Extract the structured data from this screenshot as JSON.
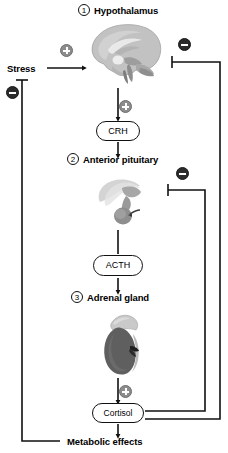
{
  "diagram": {
    "type": "biological-pathway-flowchart",
    "colors": {
      "line": "#111111",
      "plus_badge": "#8c8c8c",
      "minus_badge": "#2b2b2b",
      "background": "#ffffff",
      "anatomy_gray_light": "#c9c9c9",
      "anatomy_gray_mid": "#9a9a9a",
      "anatomy_gray_dark": "#6a6a6a"
    }
  },
  "nodes": {
    "stress": {
      "label": "Stress"
    },
    "hypothalamus": {
      "number": "1",
      "label": "Hypothalamus",
      "image": "brain-sagittal-icon"
    },
    "crh": {
      "label": "CRH"
    },
    "anterior_pituitary": {
      "number": "2",
      "label": "Anterior pituitary",
      "image": "pituitary-gland-icon"
    },
    "acth": {
      "label": "ACTH"
    },
    "adrenal_gland": {
      "number": "3",
      "label": "Adrenal gland",
      "image": "adrenal-kidney-icon"
    },
    "cortisol": {
      "label": "Cortisol"
    },
    "metabolic_effects": {
      "label": "Metabolic effects"
    }
  },
  "signs": {
    "stress_to_hypothalamus": {
      "symbol": "+",
      "name": "plus-sign"
    },
    "cortisol_inhibits_stress": {
      "symbol": "−",
      "name": "minus-sign"
    },
    "cortisol_inhibits_hypothalamus": {
      "symbol": "−",
      "name": "minus-sign"
    },
    "hypothalamus_to_crh": {
      "symbol": "+",
      "name": "plus-sign"
    },
    "cortisol_inhibits_pituitary": {
      "symbol": "−",
      "name": "minus-sign"
    },
    "adrenal_to_cortisol": {
      "symbol": "+",
      "name": "plus-sign"
    }
  },
  "edges": [
    {
      "from": "stress",
      "to": "hypothalamus",
      "kind": "stimulatory",
      "sign": "+"
    },
    {
      "from": "hypothalamus",
      "to": "crh",
      "kind": "stimulatory",
      "sign": "+"
    },
    {
      "from": "crh",
      "to": "anterior_pituitary",
      "kind": "stimulatory"
    },
    {
      "from": "anterior_pituitary",
      "to": "acth",
      "kind": "stimulatory"
    },
    {
      "from": "acth",
      "to": "adrenal_gland",
      "kind": "stimulatory"
    },
    {
      "from": "adrenal_gland",
      "to": "cortisol",
      "kind": "stimulatory",
      "sign": "+"
    },
    {
      "from": "cortisol",
      "to": "metabolic_effects",
      "kind": "stimulatory"
    },
    {
      "from": "cortisol",
      "to": "hypothalamus",
      "kind": "inhibitory",
      "sign": "−"
    },
    {
      "from": "cortisol",
      "to": "anterior_pituitary",
      "kind": "inhibitory",
      "sign": "−"
    },
    {
      "from": "metabolic_effects",
      "to": "stress",
      "kind": "inhibitory",
      "sign": "−"
    }
  ]
}
